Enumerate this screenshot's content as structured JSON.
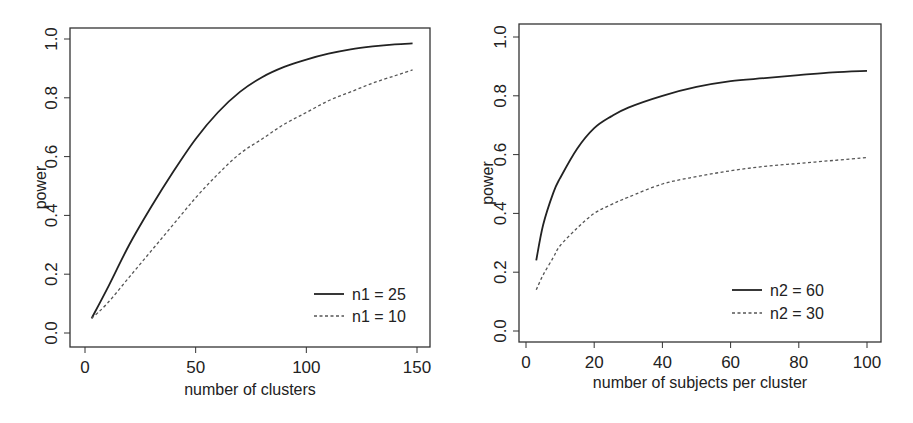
{
  "chart_data": [
    {
      "type": "line",
      "title": "",
      "xlabel": "number of clusters",
      "ylabel": "power",
      "xlim": [
        0,
        150
      ],
      "ylim": [
        0.0,
        1.0
      ],
      "x_ticks": [
        "0",
        "50",
        "100",
        "150"
      ],
      "y_ticks": [
        "0.0",
        "0.2",
        "0.4",
        "0.6",
        "0.8",
        "1.0"
      ],
      "grid": false,
      "legend_position": "bottom-right",
      "x": [
        3,
        10,
        20,
        30,
        40,
        50,
        60,
        70,
        80,
        90,
        100,
        110,
        120,
        130,
        140,
        148
      ],
      "series": [
        {
          "name": "n1 = 25",
          "style": "solid",
          "values": [
            0.05,
            0.15,
            0.3,
            0.43,
            0.55,
            0.66,
            0.75,
            0.82,
            0.87,
            0.905,
            0.93,
            0.95,
            0.965,
            0.975,
            0.982,
            0.985
          ]
        },
        {
          "name": "n1 = 10",
          "style": "dashed",
          "values": [
            0.05,
            0.1,
            0.19,
            0.28,
            0.37,
            0.46,
            0.54,
            0.61,
            0.66,
            0.71,
            0.75,
            0.79,
            0.82,
            0.85,
            0.875,
            0.895
          ]
        }
      ]
    },
    {
      "type": "line",
      "title": "",
      "xlabel": "number of subjects per cluster",
      "ylabel": "power",
      "xlim": [
        0,
        100
      ],
      "ylim": [
        0.0,
        1.0
      ],
      "x_ticks": [
        "0",
        "20",
        "40",
        "60",
        "80",
        "100"
      ],
      "y_ticks": [
        "0.0",
        "0.2",
        "0.4",
        "0.6",
        "0.8",
        "1.0"
      ],
      "grid": false,
      "legend_position": "bottom-right",
      "x": [
        3,
        5,
        8,
        10,
        15,
        20,
        25,
        30,
        40,
        50,
        60,
        70,
        80,
        90,
        100
      ],
      "series": [
        {
          "name": "n2 = 60",
          "style": "solid",
          "values": [
            0.24,
            0.36,
            0.47,
            0.52,
            0.62,
            0.69,
            0.73,
            0.76,
            0.8,
            0.83,
            0.85,
            0.86,
            0.87,
            0.88,
            0.885
          ]
        },
        {
          "name": "n2 = 30",
          "style": "dashed",
          "values": [
            0.14,
            0.19,
            0.25,
            0.29,
            0.35,
            0.4,
            0.43,
            0.455,
            0.5,
            0.525,
            0.545,
            0.56,
            0.57,
            0.58,
            0.59
          ]
        }
      ]
    }
  ]
}
